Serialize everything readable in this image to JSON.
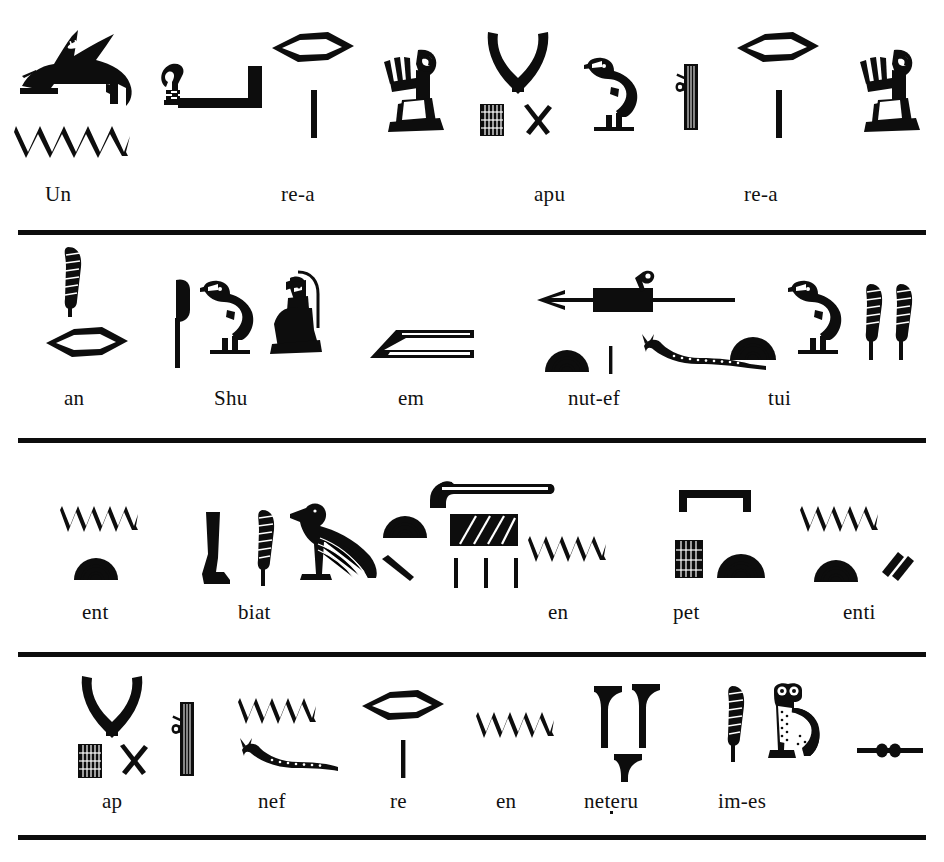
{
  "plate": {
    "kind": "hieroglyph-transliteration-plate",
    "background_color": "#ffffff",
    "ink_color": "#0d0d0d",
    "width": 944,
    "height": 862,
    "rule_count": 4
  },
  "rows": [
    {
      "index": 1,
      "rule_y": 230,
      "label_y": 182,
      "labels": [
        {
          "text": "Un",
          "x": 45,
          "glyphs": [
            "hare",
            "water-ripple"
          ]
        },
        {
          "text": "re-a",
          "x": 281,
          "glyphs": [
            "mouth",
            "stroke",
            "adoring-man"
          ]
        },
        {
          "text": "apu",
          "x": 534,
          "glyphs": [
            "horns",
            "stool",
            "crossed-sticks",
            "quail-chick",
            "scribe-palette"
          ]
        },
        {
          "text": "re-a",
          "x": 744,
          "glyphs": [
            "mouth",
            "stroke",
            "adoring-man"
          ]
        }
      ],
      "extra_glyphs": [
        "shepherds-crook-with-bar"
      ]
    },
    {
      "index": 2,
      "rule_y": 438,
      "label_y": 386,
      "labels": [
        {
          "text": "an",
          "x": 64,
          "glyphs": [
            "feather",
            "mouth"
          ]
        },
        {
          "text": "Shu",
          "x": 214,
          "glyphs": [
            "reed-flag",
            "quail-chick",
            "kneeling-god"
          ]
        },
        {
          "text": "em",
          "x": 398,
          "glyphs": [
            "owl-forearm-sign"
          ]
        },
        {
          "text": "nut-ef",
          "x": 568,
          "glyphs": [
            "harpoon-arrow",
            "loaf",
            "stroke",
            "viper"
          ]
        },
        {
          "text": "tui",
          "x": 768,
          "glyphs": [
            "loaf",
            "quail-chick",
            "double-feather"
          ]
        }
      ],
      "extra_glyphs": []
    },
    {
      "index": 3,
      "rule_y": 652,
      "label_y": 600,
      "labels": [
        {
          "text": "ent",
          "x": 82,
          "glyphs": [
            "water-ripple",
            "loaf"
          ]
        },
        {
          "text": "biat",
          "x": 238,
          "glyphs": [
            "leg",
            "feather",
            "vulture",
            "loaf",
            "stroke"
          ]
        },
        {
          "text": "en",
          "x": 548,
          "glyphs": [
            "water-ripple"
          ]
        },
        {
          "text": "pet",
          "x": 673,
          "glyphs": [
            "sky",
            "stool",
            "loaf"
          ]
        },
        {
          "text": "enti",
          "x": 843,
          "glyphs": [
            "water-ripple",
            "loaf",
            "double-stroke"
          ]
        }
      ],
      "extra_glyphs": [
        "sickle",
        "hatched-rectangle",
        "three-strokes"
      ]
    },
    {
      "index": 4,
      "rule_y": 835,
      "label_y": 789,
      "labels": [
        {
          "text": "ap",
          "x": 102,
          "glyphs": [
            "horns",
            "stool",
            "crossed-sticks",
            "scribe-palette"
          ]
        },
        {
          "text": "nef",
          "x": 258,
          "glyphs": [
            "water-ripple",
            "viper"
          ]
        },
        {
          "text": "re",
          "x": 390,
          "glyphs": [
            "mouth",
            "stroke"
          ]
        },
        {
          "text": "en",
          "x": 496,
          "glyphs": [
            "water-ripple"
          ]
        },
        {
          "text": "neteru",
          "x": 584,
          "glyphs": [
            "netjer-flag",
            "netjer-flag",
            "netjer-flag"
          ],
          "has_dot": true
        },
        {
          "text": "im-es",
          "x": 718,
          "glyphs": [
            "feather",
            "owl",
            "folded-cloth"
          ]
        }
      ],
      "extra_glyphs": []
    }
  ]
}
